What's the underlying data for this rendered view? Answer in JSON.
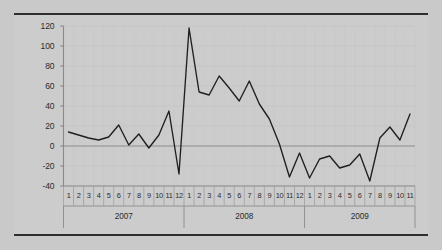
{
  "chart_data": {
    "type": "line",
    "title": "",
    "subtitle": "",
    "xlabel": "",
    "ylabel": "",
    "ylim": [
      -40,
      120
    ],
    "yticks": [
      -40,
      -20,
      0,
      20,
      40,
      60,
      80,
      100,
      120
    ],
    "ytick_labels": [
      "-40",
      "-20",
      "0",
      "20",
      "40",
      "60",
      "80",
      "100",
      "120"
    ],
    "grid": true,
    "legend": null,
    "zero_line": 0,
    "line_color": "#1f1f1f",
    "plot_background": "#d2d2d2",
    "figure_background": "#c9c9c9",
    "axis_color": "#8a8a8a",
    "x_groups": [
      {
        "label": "2007",
        "months": [
          "1",
          "2",
          "3",
          "4",
          "5",
          "6",
          "7",
          "8",
          "9",
          "10",
          "11",
          "12"
        ]
      },
      {
        "label": "2008",
        "months": [
          "1",
          "2",
          "3",
          "4",
          "5",
          "6",
          "7",
          "8",
          "9",
          "10",
          "11",
          "12"
        ]
      },
      {
        "label": "2009",
        "months": [
          "1",
          "2",
          "3",
          "4",
          "5",
          "6",
          "7",
          "8",
          "9",
          "10",
          "11"
        ]
      }
    ],
    "categories": [
      "2007-1",
      "2007-2",
      "2007-3",
      "2007-4",
      "2007-5",
      "2007-6",
      "2007-7",
      "2007-8",
      "2007-9",
      "2007-10",
      "2007-11",
      "2007-12",
      "2008-1",
      "2008-2",
      "2008-3",
      "2008-4",
      "2008-5",
      "2008-6",
      "2008-7",
      "2008-8",
      "2008-9",
      "2008-10",
      "2008-11",
      "2008-12",
      "2009-1",
      "2009-2",
      "2009-3",
      "2009-4",
      "2009-5",
      "2009-6",
      "2009-7",
      "2009-8",
      "2009-9",
      "2009-10",
      "2009-11"
    ],
    "values": [
      14,
      11,
      8,
      6,
      9,
      21,
      1,
      12,
      -2,
      11,
      35,
      -28,
      118,
      54,
      51,
      70,
      58,
      45,
      65,
      42,
      27,
      2,
      -31,
      -7,
      -32,
      -13,
      -10,
      -22,
      -19,
      -8,
      -35,
      8,
      19,
      6,
      32
    ]
  }
}
